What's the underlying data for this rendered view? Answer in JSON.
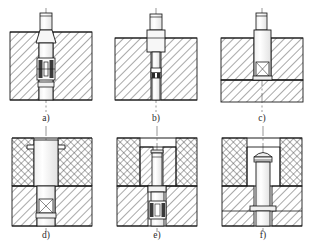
{
  "drawing": {
    "title": "Ejector pin mounting arrangements - sectional views",
    "type": "engineering-section-drawing",
    "sheet_width": 314,
    "sheet_height": 243,
    "background_color": "#ffffff",
    "line_color": "#1a1a1a",
    "hatch_color": "#333333",
    "centerline_color": "#555555",
    "rows": 2,
    "columns": 3
  },
  "panels": [
    {
      "id": "a",
      "label": "a)",
      "row": 0,
      "col": 0,
      "description": "Pin with tapered shoulder seated in single hatched block, with split collar / spring detail",
      "blocks": [
        {
          "name": "plate",
          "hatch": "diagonal",
          "x": 10,
          "y": 32,
          "w": 82,
          "h": 68
        }
      ],
      "pin": {
        "head": "cylindrical",
        "shoulder": "tapered",
        "detail": "split-bushing"
      }
    },
    {
      "id": "b",
      "label": "b)",
      "row": 0,
      "col": 1,
      "description": "Stepped pin with collar flush at block top, slender stem through block with internal key detail",
      "blocks": [
        {
          "name": "plate",
          "hatch": "diagonal",
          "x": 115,
          "y": 38,
          "w": 82,
          "h": 62
        }
      ],
      "pin": {
        "head": "cylindrical",
        "shoulder": "stepped-collar",
        "detail": "key-slot"
      }
    },
    {
      "id": "c",
      "label": "c)",
      "row": 0,
      "col": 2,
      "description": "Straight pin through upper plate resting on lower plate with small retaining block",
      "blocks": [
        {
          "name": "upper-plate",
          "hatch": "diagonal",
          "x": 218,
          "y": 38,
          "w": 82,
          "h": 42
        },
        {
          "name": "lower-plate",
          "hatch": "diagonal",
          "x": 218,
          "y": 80,
          "w": 82,
          "h": 22
        }
      ],
      "pin": {
        "head": "cylindrical",
        "shoulder": "straight",
        "detail": "retainer-block"
      }
    },
    {
      "id": "d",
      "label": "d)",
      "row": 1,
      "col": 0,
      "description": "Large bore sleeve in cross-hatched upper plate over diagonally hatched lower plate, pin with retainer",
      "blocks": [
        {
          "name": "upper-plate",
          "hatch": "cross",
          "x": 12,
          "y": 138,
          "w": 80,
          "h": 48
        },
        {
          "name": "lower-plate",
          "hatch": "diagonal",
          "x": 12,
          "y": 186,
          "w": 80,
          "h": 40
        }
      ],
      "pin": {
        "head": "sleeve",
        "shoulder": "recessed-bore",
        "detail": "retainer-block"
      }
    },
    {
      "id": "e",
      "label": "e)",
      "row": 1,
      "col": 1,
      "description": "Insert block (diagonal hatch) set into cross-hatched upper plate, pin continues into lower plate with spring detail",
      "blocks": [
        {
          "name": "upper-plate",
          "hatch": "cross",
          "x": 117,
          "y": 138,
          "w": 80,
          "h": 48
        },
        {
          "name": "insert",
          "hatch": "diagonal",
          "x": 140,
          "y": 148,
          "w": 36,
          "h": 38
        },
        {
          "name": "lower-plate",
          "hatch": "diagonal",
          "x": 117,
          "y": 186,
          "w": 80,
          "h": 40
        }
      ],
      "pin": {
        "head": "cylindrical",
        "shoulder": "stepped",
        "detail": "spring-bushing"
      }
    },
    {
      "id": "f",
      "label": "f)",
      "row": 1,
      "col": 2,
      "description": "Pin with domed head in pocket of cross-hatched upper plate, flanged foot seated on step in lower plate",
      "blocks": [
        {
          "name": "upper-plate",
          "hatch": "cross",
          "x": 222,
          "y": 138,
          "w": 80,
          "h": 48
        },
        {
          "name": "pocket",
          "hatch": "none",
          "x": 248,
          "y": 146,
          "w": 32,
          "h": 40
        },
        {
          "name": "lower-plate",
          "hatch": "diagonal",
          "x": 222,
          "y": 186,
          "w": 80,
          "h": 40
        }
      ],
      "pin": {
        "head": "domed",
        "shoulder": "flanged-foot",
        "detail": "seat-step"
      }
    }
  ]
}
